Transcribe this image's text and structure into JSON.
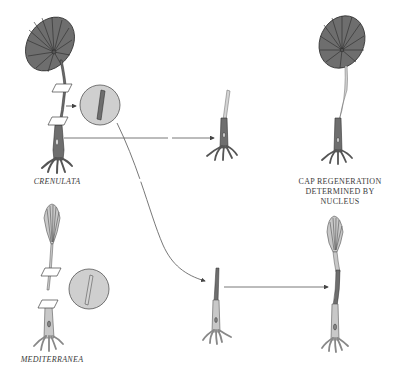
{
  "colors": {
    "background": "#ffffff",
    "crenulata_fill": "#6e6e6e",
    "crenulata_stroke": "#3a3a3a",
    "mediterranea_fill": "#c8c8c8",
    "stalk_light": "#d4d4d4",
    "circle_fill": "#cfcfcf",
    "arrow": "#555555",
    "text": "#3a3a3a"
  },
  "labels": {
    "crenulata": "CRENULATA",
    "mediterranea": "MEDITERRANEA",
    "result_line1": "CAP REGENERATION",
    "result_line2": "DETERMINED BY",
    "result_line3": "NUCLEUS"
  },
  "organisms": [
    {
      "id": "crenulata-donor",
      "species": "crenulata",
      "cap": "umbrella"
    },
    {
      "id": "mediterranea-donor",
      "species": "mediterranea",
      "cap": "cup"
    },
    {
      "id": "crenulata-rhizoid-graft",
      "species": "crenulata base + mediterranea stalk"
    },
    {
      "id": "crenulata-regenerated",
      "species": "crenulata",
      "cap": "umbrella"
    },
    {
      "id": "mediterranea-rhizoid-graft",
      "species": "mediterranea base + crenulata stalk"
    },
    {
      "id": "mediterranea-regenerated",
      "species": "mediterranea",
      "cap": "cup"
    }
  ]
}
